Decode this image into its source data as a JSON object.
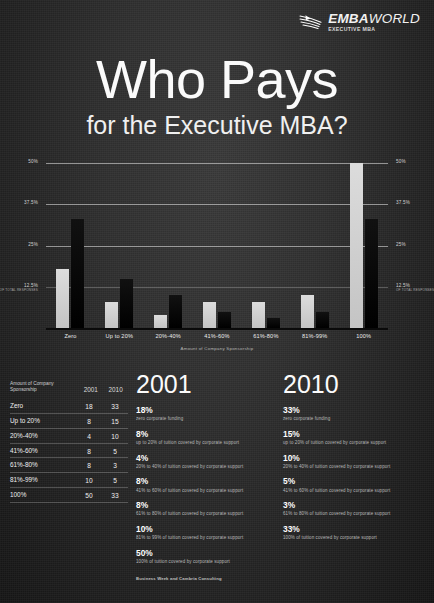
{
  "logo": {
    "name": "EMBAWORLD",
    "name_bold": "EMBA",
    "name_thin": "WORLD",
    "tagline": "EXECUTIVE MBA",
    "icon": "swoosh-icon"
  },
  "title": {
    "main": "Who Pays",
    "sub": "for the Executive MBA?"
  },
  "chart_data": {
    "type": "bar",
    "title": "Who Pays for the Executive MBA?",
    "xlabel": "Amount of Company Sponsorship",
    "ylabel": "",
    "categories": [
      "Zero",
      "Up to 20%",
      "20%-40%",
      "41%-60%",
      "61%-80%",
      "81%-99%",
      "100%"
    ],
    "series": [
      {
        "name": "2001",
        "color": "#d2d2d2",
        "values": [
          18,
          8,
          4,
          8,
          8,
          10,
          50
        ]
      },
      {
        "name": "2010",
        "color": "#0a0a0a",
        "values": [
          33,
          15,
          10,
          5,
          3,
          5,
          33
        ]
      }
    ],
    "ylim": [
      0,
      50
    ],
    "yticks": [
      "12.5%",
      "25%",
      "37.5%",
      "50%"
    ],
    "ytick_values": [
      12.5,
      25,
      37.5,
      50
    ],
    "ytick_note": "OF TOTAL RESPONSES",
    "grid": true,
    "legend": "none"
  },
  "axis": {
    "x_title": "Amount of Company Sponsorship",
    "ticks": [
      {
        "label": "50%",
        "value": 50,
        "note": ""
      },
      {
        "label": "37.5%",
        "value": 37.5,
        "note": ""
      },
      {
        "label": "25%",
        "value": 25,
        "note": ""
      },
      {
        "label": "12.5%",
        "value": 12.5,
        "note": "OF TOTAL RESPONSES"
      }
    ]
  },
  "table": {
    "header": {
      "category": "Amount of Company Sponsorship",
      "col1": "2001",
      "col2": "2010"
    },
    "rows": [
      {
        "category": "Zero",
        "v2001": "18",
        "v2010": "33"
      },
      {
        "category": "Up to 20%",
        "v2001": "8",
        "v2010": "15"
      },
      {
        "category": "20%-40%",
        "v2001": "4",
        "v2010": "10"
      },
      {
        "category": "41%-60%",
        "v2001": "8",
        "v2010": "5"
      },
      {
        "category": "61%-80%",
        "v2001": "8",
        "v2010": "3"
      },
      {
        "category": "81%-99%",
        "v2001": "10",
        "v2010": "5"
      },
      {
        "category": "100%",
        "v2001": "50",
        "v2010": "33"
      }
    ]
  },
  "column_2001": {
    "year": "2001",
    "stats": [
      {
        "pct": "18%",
        "desc": "zero corporate funding"
      },
      {
        "pct": "8%",
        "desc": "up to 20% of tuition covered by corporate support"
      },
      {
        "pct": "4%",
        "desc": "20% to 40% of tuition covered by corporate support"
      },
      {
        "pct": "8%",
        "desc": "41% to 60% of tuition covered by corporate support"
      },
      {
        "pct": "8%",
        "desc": "61% to 80% of tuition covered by corporate support"
      },
      {
        "pct": "10%",
        "desc": "81% to 99% of tuition covered by corporate support"
      },
      {
        "pct": "50%",
        "desc": "100% of tuition covered by corporate support"
      }
    ]
  },
  "column_2010": {
    "year": "2010",
    "stats": [
      {
        "pct": "33%",
        "desc": "zero corporate funding"
      },
      {
        "pct": "15%",
        "desc": "up to 20% of tuition covered by corporate support"
      },
      {
        "pct": "10%",
        "desc": "20% to 40% of tuition covered by corporate support"
      },
      {
        "pct": "5%",
        "desc": "41% to 60% of tuition covered by corporate support"
      },
      {
        "pct": "3%",
        "desc": "61% to 80% of tuition covered by corporate support"
      },
      {
        "pct": "33%",
        "desc": "100% of tuition covered by corporate support"
      }
    ]
  },
  "credit": "Business Week and Cambria Consulting",
  "colors": {
    "background": "#2b2b2b",
    "bar_2001": "#d2d2d2",
    "bar_2010": "#0a0a0a",
    "text": "#ffffff"
  }
}
